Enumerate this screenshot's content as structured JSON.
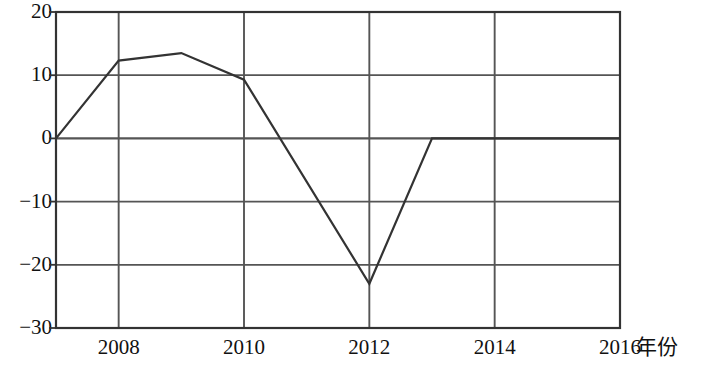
{
  "chart_data": {
    "type": "line",
    "title": "",
    "subtitle": "",
    "xlabel": "年份",
    "ylabel": "",
    "x": [
      2007,
      2008,
      2009,
      2010,
      2012,
      2013,
      2014,
      2015,
      2016
    ],
    "values": [
      0,
      12.3,
      13.5,
      9.3,
      -23,
      0,
      0,
      0,
      0
    ],
    "series": [
      {
        "name": "",
        "x": [
          2007,
          2008,
          2009,
          2010,
          2012,
          2013,
          2014,
          2015,
          2016
        ],
        "values": [
          0,
          12.3,
          13.5,
          9.3,
          -23,
          0,
          0,
          0,
          0
        ]
      }
    ],
    "xlim": [
      2007,
      2016
    ],
    "ylim": [
      -30,
      20
    ],
    "x_ticks": [
      2008,
      2010,
      2012,
      2014,
      2016
    ],
    "x_tick_labels": [
      "2008",
      "2010",
      "2012",
      "2014",
      "2016"
    ],
    "x_gridlines": [
      2008,
      2010,
      2012,
      2014,
      2016
    ],
    "y_ticks": [
      20,
      10,
      0,
      -10,
      -20,
      -30
    ],
    "y_tick_labels": [
      "20",
      "10",
      "0",
      "−10",
      "−20",
      "−30"
    ],
    "y_gridlines": [
      20,
      10,
      0,
      -10,
      -20,
      -30
    ],
    "grid": true,
    "legend": false,
    "legend_position": "none",
    "line_color": "#333333",
    "grid_color": "#555555",
    "axis_color": "#333333",
    "background_color": "#ffffff",
    "annotations": []
  }
}
